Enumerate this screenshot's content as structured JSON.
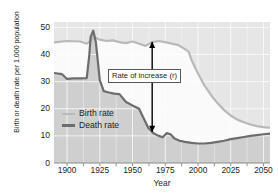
{
  "chart_data": {
    "type": "line",
    "title": "",
    "xlabel": "Year",
    "ylabel": "Birth or death rate per 1,000 population",
    "xlim": [
      1890,
      2055
    ],
    "ylim": [
      0,
      52
    ],
    "xticks": [
      1900,
      1925,
      1950,
      1975,
      2000,
      2025,
      2050
    ],
    "yticks": [
      0,
      10,
      20,
      30,
      40,
      50
    ],
    "grid": true,
    "legend_position": "inside-lower-left",
    "series": [
      {
        "name": "Birth rate",
        "color": "#b9b9b9",
        "points": [
          [
            1890,
            44.5
          ],
          [
            1900,
            45.0
          ],
          [
            1910,
            44.8
          ],
          [
            1915,
            44.0
          ],
          [
            1918,
            45.0
          ],
          [
            1920,
            46.6
          ],
          [
            1925,
            45.5
          ],
          [
            1930,
            45.0
          ],
          [
            1935,
            45.2
          ],
          [
            1940,
            44.6
          ],
          [
            1945,
            44.2
          ],
          [
            1950,
            44.8
          ],
          [
            1955,
            44.0
          ],
          [
            1960,
            43.2
          ],
          [
            1965,
            44.6
          ],
          [
            1970,
            45.0
          ],
          [
            1975,
            44.6
          ],
          [
            1980,
            44.0
          ],
          [
            1985,
            43.5
          ],
          [
            1990,
            42.0
          ],
          [
            1993,
            41.0
          ],
          [
            1995,
            38.0
          ],
          [
            2000,
            33.0
          ],
          [
            2005,
            28.5
          ],
          [
            2010,
            25.0
          ],
          [
            2015,
            22.0
          ],
          [
            2020,
            19.5
          ],
          [
            2025,
            17.5
          ],
          [
            2030,
            16.0
          ],
          [
            2035,
            15.0
          ],
          [
            2040,
            14.2
          ],
          [
            2045,
            13.6
          ],
          [
            2050,
            13.2
          ],
          [
            2055,
            13.0
          ]
        ]
      },
      {
        "name": "Death rate",
        "color": "#6d6d6d",
        "points": [
          [
            1890,
            33.2
          ],
          [
            1896,
            32.8
          ],
          [
            1900,
            31.0
          ],
          [
            1905,
            31.2
          ],
          [
            1910,
            31.2
          ],
          [
            1915,
            31.3
          ],
          [
            1917,
            40.0
          ],
          [
            1918,
            46.5
          ],
          [
            1920,
            48.8
          ],
          [
            1922,
            44.5
          ],
          [
            1925,
            30.5
          ],
          [
            1928,
            26.5
          ],
          [
            1932,
            26.0
          ],
          [
            1936,
            25.6
          ],
          [
            1940,
            25.4
          ],
          [
            1945,
            22.5
          ],
          [
            1950,
            21.2
          ],
          [
            1955,
            20.0
          ],
          [
            1958,
            17.0
          ],
          [
            1962,
            13.0
          ],
          [
            1966,
            11.0
          ],
          [
            1970,
            10.0
          ],
          [
            1973,
            9.5
          ],
          [
            1976,
            11.0
          ],
          [
            1979,
            10.6
          ],
          [
            1982,
            9.0
          ],
          [
            1986,
            8.2
          ],
          [
            1990,
            7.8
          ],
          [
            1995,
            7.4
          ],
          [
            2000,
            7.2
          ],
          [
            2005,
            7.2
          ],
          [
            2010,
            7.4
          ],
          [
            2015,
            7.8
          ],
          [
            2020,
            8.2
          ],
          [
            2025,
            8.8
          ],
          [
            2030,
            9.2
          ],
          [
            2035,
            9.6
          ],
          [
            2040,
            10.0
          ],
          [
            2045,
            10.3
          ],
          [
            2050,
            10.6
          ],
          [
            2055,
            10.8
          ]
        ]
      }
    ],
    "annotations": [
      {
        "label": "Rate of increase (r)",
        "x": 1965,
        "y_top": 44.6,
        "y_bottom": 11.5,
        "arrow": "double-headed-vertical"
      }
    ]
  },
  "axes": {
    "y_title": "Birth or death rate per 1,000 population",
    "x_title": "Year",
    "y_tick_labels": [
      "50",
      "40",
      "30",
      "20",
      "10",
      "0"
    ],
    "x_tick_labels": [
      "1900",
      "1925",
      "1950",
      "1975",
      "2000",
      "2025",
      "2050"
    ]
  },
  "legend": {
    "birth_label": "Birth rate",
    "death_label": "Death rate"
  },
  "annotation": {
    "text": "Rate of increase (r)"
  },
  "colors": {
    "birth_line": "#b9b9b9",
    "death_line": "#6d6d6d",
    "plot_background": "#e6e6e6",
    "below_death_fill": "#cfcfcf",
    "between_fill": "#fafafa",
    "gridline": "#ffffff",
    "text": "#231f20"
  }
}
